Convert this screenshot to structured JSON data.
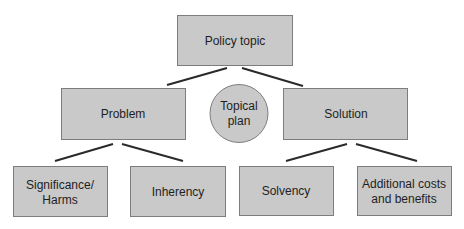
{
  "diagram": {
    "type": "hierarchy",
    "nodes": {
      "policy_topic": {
        "lines": [
          "Policy topic"
        ],
        "shape": "rectangle"
      },
      "problem": {
        "lines": [
          "Problem"
        ],
        "shape": "rectangle"
      },
      "topical_plan": {
        "lines": [
          "Topical",
          "plan"
        ],
        "shape": "circle"
      },
      "solution": {
        "lines": [
          "Solution"
        ],
        "shape": "rectangle"
      },
      "significance": {
        "lines": [
          "Significance/",
          "Harms"
        ],
        "shape": "rectangle"
      },
      "inherency": {
        "lines": [
          "Inherency"
        ],
        "shape": "rectangle"
      },
      "solvency": {
        "lines": [
          "Solvency"
        ],
        "shape": "rectangle"
      },
      "additional": {
        "lines": [
          "Additional costs",
          "and benefits"
        ],
        "shape": "rectangle"
      }
    },
    "edges": [
      [
        "policy_topic",
        "problem"
      ],
      [
        "policy_topic",
        "solution"
      ],
      [
        "problem",
        "significance"
      ],
      [
        "problem",
        "inherency"
      ],
      [
        "solution",
        "solvency"
      ],
      [
        "solution",
        "additional"
      ]
    ],
    "colors": {
      "fill": "#c9c9c9",
      "border": "#7d7d7d",
      "connector": "#2a2a2a",
      "text": "#1e1e1e"
    }
  }
}
